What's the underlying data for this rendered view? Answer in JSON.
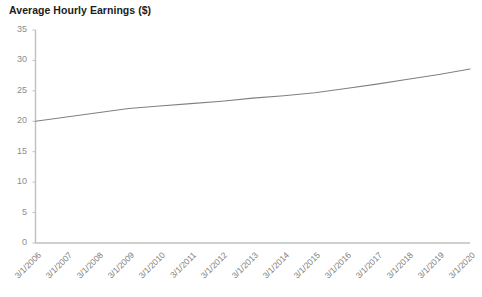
{
  "chart_data": {
    "type": "line",
    "title": "Average Hourly Earnings ($)",
    "xlabel": "",
    "ylabel": "",
    "grid": false,
    "legend": null,
    "line_color": "#808080",
    "axis_color": "#bfbfbf",
    "categories": [
      "3/1/2006",
      "3/1/2007",
      "3/1/2008",
      "3/1/2009",
      "3/1/2010",
      "3/1/2011",
      "3/1/2012",
      "3/1/2013",
      "3/1/2014",
      "3/1/2015",
      "3/1/2016",
      "3/1/2017",
      "3/1/2018",
      "3/1/2019",
      "3/1/2020"
    ],
    "values": [
      20.0,
      20.7,
      21.4,
      22.1,
      22.5,
      22.9,
      23.3,
      23.8,
      24.2,
      24.7,
      25.4,
      26.1,
      26.9,
      27.7,
      28.6
    ],
    "ylim": [
      0,
      35
    ],
    "yticks": [
      0,
      5,
      10,
      15,
      20,
      25,
      30,
      35
    ],
    "ytick_labels": [
      "0",
      "5",
      "10",
      "15",
      "20",
      "25",
      "30",
      "35"
    ],
    "xtick_rotation": -45
  }
}
